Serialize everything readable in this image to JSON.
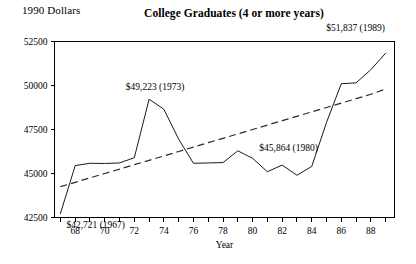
{
  "chart_data": {
    "type": "line",
    "title": "College Graduates (4 or more years)",
    "unit_label": "1990 Dollars",
    "xlabel": "Year",
    "ylabel": "",
    "xlim": [
      1966.6,
      1989.6
    ],
    "ylim": [
      42500,
      52500
    ],
    "grid": false,
    "legend": "none",
    "ytick_labels": [
      "52500",
      "50000",
      "47500",
      "45000",
      "42500"
    ],
    "ytick_values": [
      52500,
      50000,
      47500,
      45000,
      42500
    ],
    "xtick_labels": [
      "68",
      "70",
      "72",
      "74",
      "76",
      "78",
      "80",
      "82",
      "84",
      "86",
      "88"
    ],
    "xtick_values": [
      1968,
      1970,
      1972,
      1974,
      1976,
      1978,
      1980,
      1982,
      1984,
      1986,
      1988
    ],
    "x": [
      1967,
      1968,
      1969,
      1970,
      1971,
      1972,
      1973,
      1974,
      1975,
      1976,
      1977,
      1978,
      1979,
      1980,
      1981,
      1982,
      1983,
      1984,
      1985,
      1986,
      1987,
      1988,
      1989
    ],
    "series": [
      {
        "name": "Median income of college graduates",
        "style": "solid",
        "values": [
          42721,
          45450,
          45580,
          45570,
          45600,
          45900,
          49223,
          48650,
          46950,
          45580,
          45600,
          45620,
          46290,
          45864,
          45100,
          45480,
          44900,
          45400,
          47900,
          50100,
          50150,
          50900,
          51837
        ]
      },
      {
        "name": "Linear trend",
        "style": "dashed",
        "values": [
          44250,
          44500,
          44750,
          45000,
          45250,
          45500,
          45750,
          46000,
          46250,
          46500,
          46750,
          47000,
          47250,
          47500,
          47750,
          48000,
          48250,
          48500,
          48750,
          49000,
          49250,
          49500,
          49800
        ]
      }
    ],
    "annotations": [
      {
        "text": "$42,721 (1967)",
        "year": 1967,
        "value": 42721,
        "anchor": "start"
      },
      {
        "text": "$49,223 (1973)",
        "year": 1973,
        "value": 49223,
        "anchor": "middle"
      },
      {
        "text": "$45,864 (1980)",
        "year": 1980,
        "value": 45864,
        "anchor": "middle"
      },
      {
        "text": "$51,837 (1989)",
        "year": 1989,
        "value": 51837,
        "anchor": "middle"
      }
    ]
  }
}
